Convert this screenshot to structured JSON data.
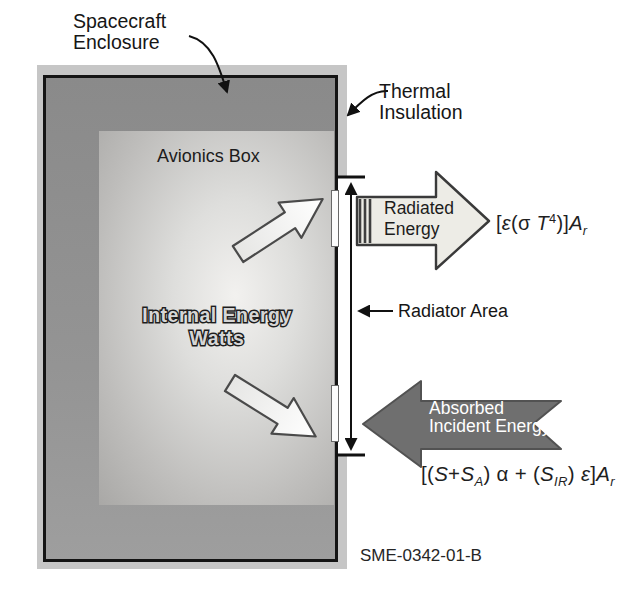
{
  "figure": {
    "id_label": "SME-0342-01-B"
  },
  "labels": {
    "spacecraft_enclosure": {
      "line1": "Spacecraft",
      "line2": "Enclosure"
    },
    "thermal_insulation": {
      "line1": "Thermal",
      "line2": "Insulation"
    },
    "avionics_box": "Avionics Box",
    "internal_energy": {
      "line1": "Internal Energy",
      "line2": "Watts"
    },
    "radiator_area": "Radiator Area"
  },
  "flow_arrows": {
    "radiated": {
      "line1": "Radiated",
      "line2": "Energy"
    },
    "absorbed": {
      "line1": "Absorbed",
      "line2": "Incident Energy"
    }
  },
  "equations": {
    "radiated": {
      "parts": [
        "[",
        "ε",
        "(σ ",
        "T",
        "4",
        ")]",
        "A",
        "r"
      ]
    },
    "absorbed": {
      "parts": [
        "[(",
        "S",
        "+",
        "S",
        "A",
        ") α + (",
        "S",
        "IR",
        ") ",
        "ε",
        "]",
        "A",
        "r"
      ]
    }
  },
  "colors": {
    "insulation": "#c6c6c6",
    "enclosure_wall": "#919191",
    "enclosure_border": "#141414",
    "avionics_box": "#d8d7d5",
    "radiated_arrow_fill": "#edece6",
    "absorbed_arrow_fill": "#6f6f6f",
    "internal_arrow_fill": "#f4f4f2",
    "text": "#1a1a1a"
  }
}
